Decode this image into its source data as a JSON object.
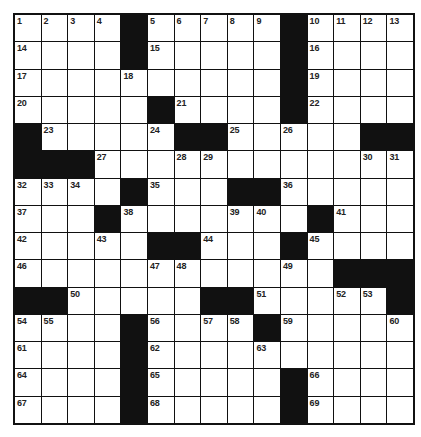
{
  "puzzle": {
    "rows": 15,
    "cols": 15,
    "colors": {
      "block": "#111111",
      "cell": "#ffffff",
      "line": "#111111"
    },
    "layout": [
      "....#.....#....",
      "....#.....#....",
      "..........#....",
      ".....#....#....",
      "#.....##.....##",
      "###............",
      "....#...##.....",
      "...#.......#...",
      ".....##...#....",
      "............###",
      "##.....##.....#",
      "....#....#.....",
      "....#..........",
      "....#.....#....",
      "....#.....#...."
    ],
    "numbers": [
      [
        1,
        2,
        3,
        4,
        null,
        5,
        6,
        7,
        8,
        9,
        null,
        10,
        11,
        12,
        13
      ],
      [
        14,
        null,
        null,
        null,
        null,
        15,
        null,
        null,
        null,
        null,
        null,
        16,
        null,
        null,
        null
      ],
      [
        17,
        null,
        null,
        null,
        18,
        null,
        null,
        null,
        null,
        null,
        null,
        19,
        null,
        null,
        null
      ],
      [
        20,
        null,
        null,
        null,
        null,
        null,
        21,
        null,
        null,
        null,
        null,
        22,
        null,
        null,
        null
      ],
      [
        null,
        23,
        null,
        null,
        null,
        24,
        null,
        null,
        25,
        null,
        26,
        null,
        null,
        null,
        null
      ],
      [
        null,
        null,
        null,
        27,
        null,
        null,
        28,
        29,
        null,
        null,
        null,
        null,
        null,
        30,
        31
      ],
      [
        32,
        33,
        34,
        null,
        null,
        35,
        null,
        null,
        null,
        null,
        36,
        null,
        null,
        null,
        null
      ],
      [
        37,
        null,
        null,
        null,
        38,
        null,
        null,
        null,
        39,
        40,
        null,
        null,
        41,
        null,
        null
      ],
      [
        42,
        null,
        null,
        43,
        null,
        null,
        null,
        44,
        null,
        null,
        null,
        45,
        null,
        null,
        null
      ],
      [
        46,
        null,
        null,
        null,
        null,
        47,
        48,
        null,
        null,
        null,
        49,
        null,
        null,
        null,
        null
      ],
      [
        null,
        null,
        50,
        null,
        null,
        null,
        null,
        null,
        null,
        51,
        null,
        null,
        52,
        53,
        null
      ],
      [
        54,
        55,
        null,
        null,
        null,
        56,
        null,
        57,
        58,
        null,
        59,
        null,
        null,
        null,
        60
      ],
      [
        61,
        null,
        null,
        null,
        null,
        62,
        null,
        null,
        null,
        63,
        null,
        null,
        null,
        null,
        null
      ],
      [
        64,
        null,
        null,
        null,
        null,
        65,
        null,
        null,
        null,
        null,
        null,
        66,
        null,
        null,
        null
      ],
      [
        67,
        null,
        null,
        null,
        null,
        68,
        null,
        null,
        null,
        null,
        null,
        69,
        null,
        null,
        null
      ]
    ]
  }
}
